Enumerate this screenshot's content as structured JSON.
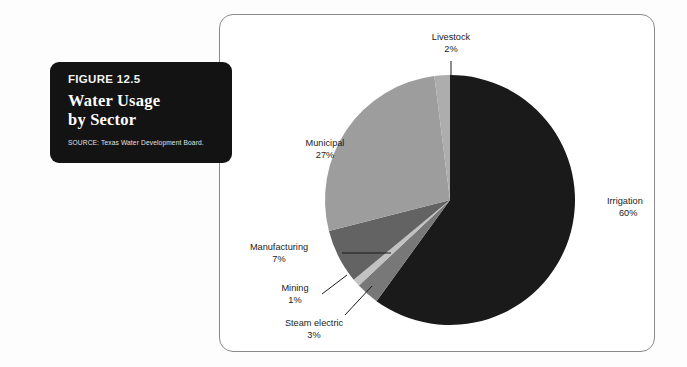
{
  "figure": {
    "number_label": "FIGURE 12.5",
    "title_line1": "Water Usage",
    "title_line2": "by Sector",
    "source": "SOURCE: Texas Water Development Board."
  },
  "colors": {
    "card_background": "#131313",
    "frame_border": "#8a8a8a",
    "page_background": "#ffffff",
    "label_text": "#1b1b1b"
  },
  "chart_data": {
    "type": "pie",
    "title": "Water Usage by Sector",
    "xlabel": "",
    "ylabel": "",
    "units": "percent",
    "legend_position": "none",
    "grid": false,
    "start_angle_deg": 0,
    "direction": "clockwise",
    "categories": [
      "Irrigation",
      "Steam electric",
      "Mining",
      "Manufacturing",
      "Municipal",
      "Livestock"
    ],
    "values": [
      60,
      3,
      1,
      7,
      27,
      2
    ],
    "slice_colors": [
      "#1a1a1a",
      "#787878",
      "#c2c2c2",
      "#636363",
      "#9d9d9d",
      "#adadad"
    ],
    "slices": [
      {
        "label": "Irrigation",
        "value": 60,
        "value_label": "60%",
        "color": "#1a1a1a"
      },
      {
        "label": "Steam electric",
        "value": 3,
        "value_label": "3%",
        "color": "#787878"
      },
      {
        "label": "Mining",
        "value": 1,
        "value_label": "1%",
        "color": "#c2c2c2"
      },
      {
        "label": "Manufacturing",
        "value": 7,
        "value_label": "7%",
        "color": "#636363"
      },
      {
        "label": "Municipal",
        "value": 27,
        "value_label": "27%",
        "color": "#9d9d9d"
      },
      {
        "label": "Livestock",
        "value": 2,
        "value_label": "2%",
        "color": "#adadad"
      }
    ]
  }
}
